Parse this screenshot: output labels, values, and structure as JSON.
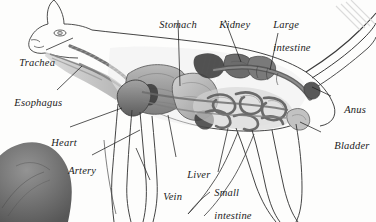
{
  "figure": {
    "title": "",
    "style": "grayscale pencil-and-wash anatomical illustration",
    "background_color": "#fdfdfc",
    "ink_color": "#1b1b1b",
    "organ_tone_dark": "#4a4a4a",
    "organ_tone_mid": "#8d8d8d",
    "organ_tone_light": "#c9c9c9"
  },
  "labels": [
    {
      "id": "stomach",
      "text": "Stomach",
      "line2": "",
      "x": 148,
      "y": 7,
      "align": "left"
    },
    {
      "id": "kidney",
      "text": "Kidney",
      "line2": "",
      "x": 208,
      "y": 7,
      "align": "left"
    },
    {
      "id": "large-intestine",
      "text": "Large",
      "line2": "intestine",
      "x": 262,
      "y": 7,
      "align": "left"
    },
    {
      "id": "trachea",
      "text": "Trachea",
      "line2": "",
      "x": 8,
      "y": 45,
      "align": "left"
    },
    {
      "id": "esophagus",
      "text": "Esophagus",
      "line2": "",
      "x": 3,
      "y": 85,
      "align": "left"
    },
    {
      "id": "anus",
      "text": "Anus",
      "line2": "",
      "x": 333,
      "y": 92,
      "align": "left"
    },
    {
      "id": "heart",
      "text": "Heart",
      "line2": "",
      "x": 40,
      "y": 125,
      "align": "left"
    },
    {
      "id": "bladder",
      "text": "Bladder",
      "line2": "",
      "x": 323,
      "y": 128,
      "align": "left"
    },
    {
      "id": "artery",
      "text": "Artery",
      "line2": "",
      "x": 57,
      "y": 153,
      "align": "left"
    },
    {
      "id": "liver",
      "text": "Liver",
      "line2": "",
      "x": 176,
      "y": 157,
      "align": "left"
    },
    {
      "id": "vein",
      "text": "Vein",
      "line2": "",
      "x": 152,
      "y": 179,
      "align": "left"
    },
    {
      "id": "small-intestine",
      "text": "Small",
      "line2": "intestine",
      "x": 203,
      "y": 175,
      "align": "left"
    }
  ],
  "leader_lines": [
    {
      "id": "stomach-leader",
      "from": [
        178,
        20
      ],
      "to": [
        180,
        86
      ]
    },
    {
      "id": "kidney-leader",
      "from": [
        225,
        20
      ],
      "to": [
        241,
        62
      ]
    },
    {
      "id": "large-intestine-leader",
      "from": [
        278,
        33
      ],
      "to": [
        270,
        70
      ]
    },
    {
      "id": "trachea-leader",
      "from": [
        46,
        50
      ],
      "to": [
        73,
        38
      ]
    },
    {
      "id": "esophagus-leader",
      "from": [
        57,
        90
      ],
      "to": [
        82,
        66
      ]
    },
    {
      "id": "anus-leader",
      "from": [
        331,
        96
      ],
      "to": [
        312,
        87
      ]
    },
    {
      "id": "bladder-leader",
      "from": [
        321,
        132
      ],
      "to": [
        300,
        122
      ]
    },
    {
      "id": "heart-leader",
      "from": [
        70,
        127
      ],
      "to": [
        122,
        108
      ]
    },
    {
      "id": "artery-leader",
      "from": [
        92,
        155
      ],
      "to": [
        140,
        130
      ]
    },
    {
      "id": "liver-leader",
      "from": [
        176,
        157
      ],
      "to": [
        168,
        115
      ]
    },
    {
      "id": "vein-leader",
      "from": [
        150,
        180
      ],
      "to": [
        136,
        148
      ]
    },
    {
      "id": "small-intestine-leader",
      "from": [
        218,
        172
      ],
      "to": [
        228,
        128
      ]
    }
  ],
  "organs_depicted": [
    "trachea",
    "esophagus",
    "heart",
    "artery",
    "vein",
    "liver",
    "stomach",
    "kidney",
    "large intestine",
    "small intestine",
    "bladder",
    "anus"
  ]
}
